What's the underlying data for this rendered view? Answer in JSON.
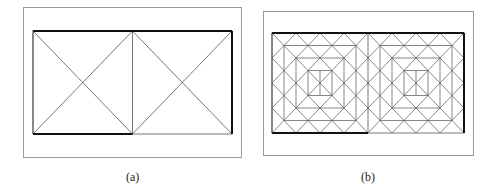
{
  "figure": {
    "panels": [
      {
        "id": "a",
        "caption": "(a)",
        "frame": {
          "x": 23,
          "y": 7,
          "w": 218,
          "h": 150
        },
        "mesh": {
          "x": 33,
          "y": 31,
          "w": 199,
          "h": 103,
          "subdivisions": 1
        }
      },
      {
        "id": "b",
        "caption": "(b)",
        "frame": {
          "x": 263,
          "y": 11,
          "w": 210,
          "h": 144
        },
        "mesh": {
          "x": 272,
          "y": 33,
          "w": 192,
          "h": 100,
          "subdivisions": 8
        }
      }
    ],
    "colors": {
      "frame": "#9a9a9a",
      "thin": "#555555",
      "bold": "#111111"
    }
  }
}
